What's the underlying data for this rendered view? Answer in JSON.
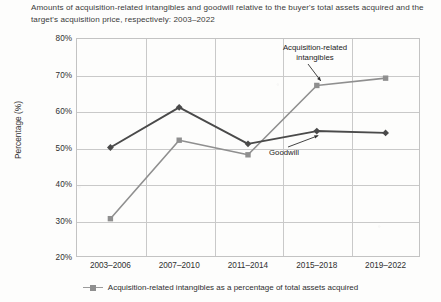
{
  "chart_data": {
    "type": "line",
    "title": "Amounts of acquisition-related intangibles and goodwill relative to the buyer's total assets acquired and the target's acquisition price, respectively: 2003–2022",
    "xlabel": "",
    "ylabel": "Percentage (%)",
    "categories": [
      "2003–2006",
      "2007–2010",
      "2011–2014",
      "2015–2018",
      "2019–2022"
    ],
    "ylim": [
      20,
      80
    ],
    "ytick_labels": [
      "80%",
      "70%",
      "60%",
      "50%",
      "40%",
      "30%",
      "20%"
    ],
    "ytick_values": [
      80,
      70,
      60,
      50,
      40,
      30,
      20
    ],
    "grid": true,
    "legend_position": "bottom",
    "series": [
      {
        "name": "Acquisition-related intangibles as a percentage of total assets acquired",
        "short_name": "Acquisition-related intangibles",
        "values": [
          30.5,
          52.0,
          48.0,
          67.0,
          69.0
        ],
        "color": "#8f8f8f",
        "marker": "square"
      },
      {
        "name": "Goodwill",
        "short_name": "Goodwill",
        "values": [
          50.0,
          61.0,
          51.0,
          54.5,
          54.0
        ],
        "color": "#4a4a4a",
        "marker": "diamond"
      }
    ],
    "annotations": [
      {
        "text_line1": "Acquisition-related",
        "text_line2": "intangibles",
        "target_series": "Acquisition-related intangibles"
      },
      {
        "text_line1": "Goodwill",
        "text_line2": "",
        "target_series": "Goodwill"
      }
    ]
  },
  "legend": {
    "entries": [
      {
        "label": "Acquisition-related intangibles as a percentage of total assets acquired",
        "marker": "square",
        "color": "#8f8f8f"
      }
    ]
  }
}
